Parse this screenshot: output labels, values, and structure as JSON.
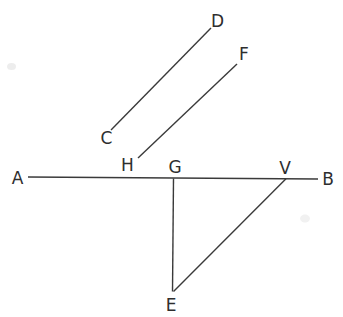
{
  "figure": {
    "canvas": {
      "width": 343,
      "height": 317,
      "background": "#ffffff"
    },
    "style": {
      "stroke_color": "#3a3a3a",
      "stroke_width": 1.4,
      "label_color": "#2e2e2e",
      "label_font_size": 17
    },
    "labels": [
      {
        "text": "A",
        "x": 17.5,
        "y": 178
      },
      {
        "text": "B",
        "x": 328,
        "y": 178.5
      },
      {
        "text": "C",
        "x": 106.5,
        "y": 138
      },
      {
        "text": "D",
        "x": 217.5,
        "y": 20.5
      },
      {
        "text": "E",
        "x": 171,
        "y": 305
      },
      {
        "text": "F",
        "x": 244,
        "y": 54
      },
      {
        "text": "G",
        "x": 175,
        "y": 166.5
      },
      {
        "text": "H",
        "x": 127.5,
        "y": 164.5
      },
      {
        "text": "V",
        "x": 285,
        "y": 167.5
      }
    ],
    "segments": [
      {
        "name": "line-AB",
        "x1": 28,
        "y1": 177,
        "x2": 318,
        "y2": 179
      },
      {
        "name": "segment-CD",
        "x1": 111,
        "y1": 130,
        "x2": 211,
        "y2": 28
      },
      {
        "name": "segment-HF",
        "x1": 138,
        "y1": 158,
        "x2": 237,
        "y2": 64
      },
      {
        "name": "segment-GE",
        "x1": 173.5,
        "y1": 178.5,
        "x2": 172.5,
        "y2": 291.5
      },
      {
        "name": "segment-VE",
        "x1": 286,
        "y1": 178.8,
        "x2": 173.5,
        "y2": 291.5
      }
    ],
    "artifacts": [
      {
        "name": "scan-smudge-left",
        "cx": 11.5,
        "cy": 66.5,
        "rx": 4.5,
        "ry": 3.5,
        "color": "#e6e6e6"
      },
      {
        "name": "scan-smudge-right",
        "cx": 305,
        "cy": 218.5,
        "rx": 5,
        "ry": 4,
        "color": "#ebebeb"
      }
    ]
  }
}
